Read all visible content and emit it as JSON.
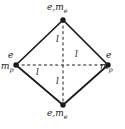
{
  "figure": {
    "background_color": "#ffffff",
    "line_color": "#1a1a1a",
    "vertices": [
      {
        "position": "top",
        "x": 63,
        "y": 20,
        "charge_symbol": "e",
        "mass_symbol": "m",
        "mass_subscript": "e",
        "label": "e,me",
        "particle": "electron"
      },
      {
        "position": "left",
        "x": 16,
        "y": 65,
        "charge_symbol": "e",
        "mass_symbol": "m",
        "mass_subscript": "p",
        "label": "e,mp",
        "particle": "proton"
      },
      {
        "position": "right",
        "x": 108,
        "y": 65,
        "charge_symbol": "e",
        "mass_symbol": "m",
        "mass_subscript": "p",
        "label": "e,mp",
        "particle": "proton"
      },
      {
        "position": "bottom",
        "x": 63,
        "y": 105,
        "charge_symbol": "e",
        "mass_symbol": "m",
        "mass_subscript": "e",
        "label": "e,me",
        "particle": "electron"
      }
    ],
    "edges": [
      {
        "from": "top",
        "to": "left",
        "style": "solid"
      },
      {
        "from": "top",
        "to": "right",
        "style": "solid"
      },
      {
        "from": "bottom",
        "to": "left",
        "style": "solid"
      },
      {
        "from": "bottom",
        "to": "right",
        "style": "solid"
      }
    ],
    "diagonals": [
      {
        "from": "top",
        "to": "bottom",
        "style": "dashed",
        "orientation": "vertical"
      },
      {
        "from": "left",
        "to": "right",
        "style": "dashed",
        "orientation": "horizontal"
      }
    ],
    "length_labels": [
      {
        "id": "len-top",
        "text": "l",
        "segment": "upper-vertical"
      },
      {
        "id": "len-bottom",
        "text": "l",
        "segment": "lower-vertical"
      },
      {
        "id": "len-leftseg",
        "text": "l",
        "segment": "left-horizontal"
      },
      {
        "id": "len-rightseg",
        "text": "l",
        "segment": "right-horizontal"
      }
    ]
  }
}
